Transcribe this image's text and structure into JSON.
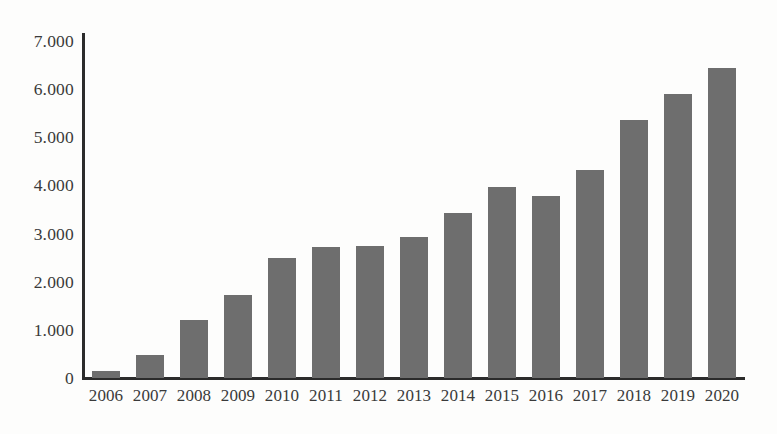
{
  "chart_data": {
    "type": "bar",
    "title": "",
    "subtitle": "",
    "xlabel": "",
    "ylabel": "",
    "categories": [
      "2006",
      "2007",
      "2008",
      "2009",
      "2010",
      "2011",
      "2012",
      "2013",
      "2014",
      "2015",
      "2016",
      "2017",
      "2018",
      "2019",
      "2020"
    ],
    "values": [
      145,
      480,
      1205,
      1720,
      2490,
      2720,
      2745,
      2930,
      3420,
      3960,
      3790,
      4330,
      5350,
      5890,
      6440
    ],
    "ytick_labels": [
      "0",
      "1.000",
      "2.000",
      "3.000",
      "4.000",
      "5.000",
      "6.000",
      "7.000"
    ],
    "ytick_values": [
      0,
      1000,
      2000,
      3000,
      4000,
      5000,
      6000,
      7000
    ],
    "ylim": [
      0,
      7000
    ],
    "grid": false,
    "legend": "none",
    "bar_color": "#6e6e6e",
    "axis_color": "#2b2b2b",
    "background_color": "#fdfdfc"
  }
}
